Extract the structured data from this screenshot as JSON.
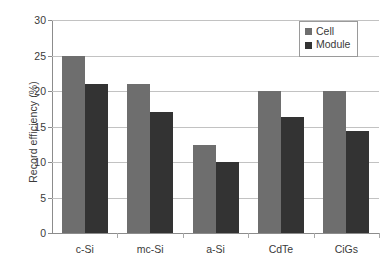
{
  "chart_data": {
    "type": "bar",
    "title": "",
    "subtitle": "",
    "xlabel": "",
    "ylabel": "Record efficiency (%)",
    "categories": [
      "c-Si",
      "mc-Si",
      "a-Si",
      "CdTe",
      "CiGs"
    ],
    "series": [
      {
        "name": "Cell",
        "color": "#6e6e6e",
        "values": [
          25,
          21,
          12.4,
          20,
          20
        ]
      },
      {
        "name": "Module",
        "color": "#333333",
        "values": [
          21,
          17,
          10,
          16.3,
          14.4
        ]
      }
    ],
    "ylim": [
      0,
      30
    ],
    "yticks": [
      0,
      5,
      10,
      15,
      20,
      25,
      30
    ],
    "ytick_labels": [
      "0",
      "5",
      "10",
      "15",
      "20",
      "25",
      "30"
    ],
    "grid": true,
    "grid_axis": "y",
    "legend_position": "top-right",
    "legend_border": true,
    "background": "#ffffff",
    "grid_color": "#c2c2c2",
    "axis_color": "#8c8c8c",
    "text_color": "#3a3a3a"
  }
}
